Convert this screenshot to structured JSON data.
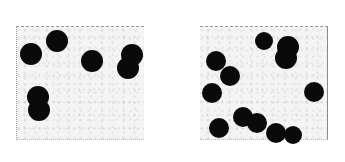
{
  "image": {
    "description": "Two side-by-side speckled gray panels containing black dots (numerosity comparison stimulus)",
    "background": "#ffffff",
    "dot_color": "#0a0a0a",
    "panel_color": "#f4f4f4"
  },
  "panels": [
    {
      "name": "left-panel",
      "box": {
        "x": 16,
        "y": 26,
        "w": 127,
        "h": 112
      },
      "dots": [
        {
          "x": 31,
          "y": 54,
          "r": 11
        },
        {
          "x": 57,
          "y": 41,
          "r": 11
        },
        {
          "x": 92,
          "y": 61,
          "r": 11
        },
        {
          "x": 132,
          "y": 55,
          "r": 11
        },
        {
          "x": 128,
          "y": 68,
          "r": 11
        },
        {
          "x": 38,
          "y": 97,
          "r": 11
        },
        {
          "x": 39,
          "y": 110,
          "r": 11
        }
      ]
    },
    {
      "name": "right-panel",
      "box": {
        "x": 200,
        "y": 26,
        "w": 127,
        "h": 112
      },
      "dots": [
        {
          "x": 264,
          "y": 41,
          "r": 9
        },
        {
          "x": 288,
          "y": 47,
          "r": 11
        },
        {
          "x": 286,
          "y": 58,
          "r": 11
        },
        {
          "x": 216,
          "y": 61,
          "r": 10
        },
        {
          "x": 230,
          "y": 76,
          "r": 10
        },
        {
          "x": 212,
          "y": 93,
          "r": 10
        },
        {
          "x": 314,
          "y": 92,
          "r": 10
        },
        {
          "x": 219,
          "y": 128,
          "r": 10
        },
        {
          "x": 243,
          "y": 117,
          "r": 10
        },
        {
          "x": 257,
          "y": 123,
          "r": 10
        },
        {
          "x": 276,
          "y": 133,
          "r": 10
        },
        {
          "x": 293,
          "y": 135,
          "r": 9
        }
      ]
    }
  ]
}
